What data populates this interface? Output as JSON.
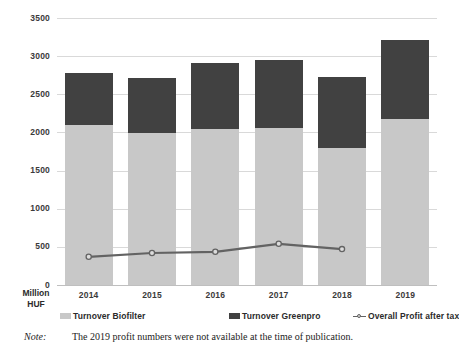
{
  "chart_data": {
    "type": "bar",
    "title": "",
    "subtitle": "",
    "xlabel": "",
    "ylabel": "Million HUF",
    "ylim": [
      0,
      3500
    ],
    "ytick_step": 500,
    "ytick_labels": [
      "3500",
      "3000",
      "2500",
      "2000",
      "1500",
      "1000",
      "500",
      "0"
    ],
    "grid": true,
    "stacked": true,
    "legend_position": "bottom",
    "categories": [
      "2014",
      "2015",
      "2016",
      "2017",
      "2018",
      "2019"
    ],
    "series": [
      {
        "name": "Turnover Biofilter",
        "type": "bar",
        "color": "#c8c8c8",
        "values": [
          2100,
          1990,
          2045,
          2060,
          1795,
          2175
        ]
      },
      {
        "name": "Turnover Greenpro",
        "type": "bar",
        "color": "#414141",
        "values": [
          680,
          720,
          860,
          890,
          930,
          1035
        ]
      },
      {
        "name": "Overall Profit after tax",
        "type": "line",
        "color": "#636363",
        "values": [
          370,
          420,
          435,
          540,
          470,
          null
        ]
      }
    ],
    "stack_totals": [
      2780,
      2710,
      2905,
      2950,
      2725,
      3210
    ],
    "annotations": []
  },
  "axis": {
    "unit_line1": "Million",
    "unit_line2": "HUF"
  },
  "legend": {
    "items": [
      {
        "label": "Turnover Biofilter",
        "marker": "swatch",
        "color": "#c8c8c8"
      },
      {
        "label": "Turnover Greenpro",
        "marker": "swatch",
        "color": "#414141"
      },
      {
        "label": "Overall Profit after tax",
        "marker": "line-dot",
        "color": "#636363"
      }
    ]
  },
  "note": {
    "label": "Note:",
    "text": "The 2019 profit numbers were not available at the time of publication."
  },
  "colors": {
    "biofilter": "#c8c8c8",
    "greenpro": "#414141",
    "profit_line": "#636363",
    "gridline": "#d9d9d9",
    "text": "#2b2b2b"
  }
}
